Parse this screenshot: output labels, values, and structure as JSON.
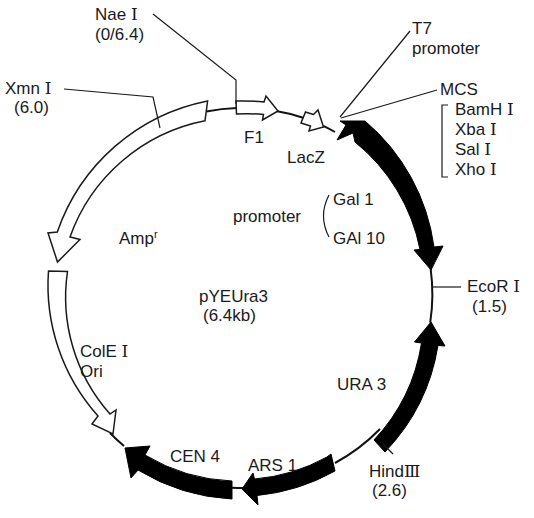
{
  "plasmid": {
    "name": "pYEUra3",
    "size": "(6.4kb)",
    "size_kb": 6.4
  },
  "features": [
    {
      "id": "f1",
      "label": "F1",
      "type": "open-arrow"
    },
    {
      "id": "lacz",
      "label": "LacZ",
      "type": "open-arrow"
    },
    {
      "id": "gal",
      "label": "promoter",
      "sub": [
        "Gal 1",
        "GAl 10"
      ],
      "type": "filled-arrow"
    },
    {
      "id": "ura3",
      "label": "URA 3",
      "type": "filled-arrow"
    },
    {
      "id": "ars1",
      "label": "ARS 1",
      "type": "filled-arrow"
    },
    {
      "id": "cen4",
      "label": "CEN 4",
      "type": "filled-arrow"
    },
    {
      "id": "cole1",
      "label": "ColE",
      "label_roman": "Ⅰ",
      "label2": "Ori",
      "type": "open-arrow"
    },
    {
      "id": "amp",
      "label": "Amp",
      "sup": "r",
      "type": "open-arrow"
    }
  ],
  "sites": [
    {
      "id": "nae1",
      "name": "Nae ",
      "roman": "Ⅰ",
      "pos": "(0/6.4)"
    },
    {
      "id": "xmn1",
      "name": "Xmn ",
      "roman": "Ⅰ",
      "pos": "(6.0)"
    },
    {
      "id": "ecor1",
      "name": "EcoR ",
      "roman": "Ⅰ",
      "pos": "(1.5)"
    },
    {
      "id": "hind3",
      "name": "Hind",
      "roman": "Ⅲ",
      "pos": "(2.6)"
    }
  ],
  "t7": {
    "line1": "T7",
    "line2": "promoter"
  },
  "mcs": {
    "title": "MCS",
    "enzymes": [
      {
        "name": "BamH ",
        "roman": "Ⅰ"
      },
      {
        "name": "Xba ",
        "roman": "Ⅰ"
      },
      {
        "name": "Sal ",
        "roman": "Ⅰ"
      },
      {
        "name": "Xho ",
        "roman": "Ⅰ"
      }
    ]
  },
  "colors": {
    "filled": "#000000",
    "open_fill": "#ffffff",
    "stroke": "#1a1a1a"
  }
}
